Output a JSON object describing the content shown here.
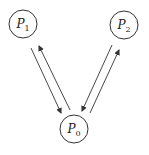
{
  "diagram": {
    "nodes": [
      {
        "id": "P1",
        "label": "P",
        "sub": "1",
        "cx": 23,
        "cy": 24,
        "r": 14
      },
      {
        "id": "P2",
        "label": "P",
        "sub": "2",
        "cx": 124,
        "cy": 25,
        "r": 14
      },
      {
        "id": "P0",
        "label": "P",
        "sub": "0",
        "cx": 74,
        "cy": 129,
        "r": 14
      }
    ],
    "edges": [
      {
        "from": "P1",
        "to": "P0",
        "x1": 31,
        "y1": 48,
        "x2": 61,
        "y2": 113
      },
      {
        "from": "P0",
        "to": "P1",
        "x1": 70,
        "y1": 110,
        "x2": 39,
        "y2": 46
      },
      {
        "from": "P2",
        "to": "P0",
        "x1": 112,
        "y1": 45,
        "x2": 82,
        "y2": 111
      },
      {
        "from": "P0",
        "to": "P2",
        "x1": 90,
        "y1": 113,
        "x2": 119,
        "y2": 50
      }
    ],
    "stroke_color": "#333333"
  }
}
